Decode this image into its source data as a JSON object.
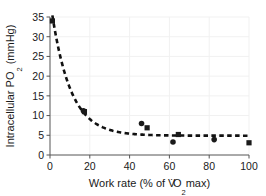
{
  "chart_data": {
    "type": "scatter",
    "title": "",
    "xlabel": "Work rate (% of VO2max)",
    "xlabel_parts": {
      "pre": "Work rate (% of ",
      "v": "V",
      "overdot": "˙",
      "o": "O",
      "sub": "2",
      "post": "max)"
    },
    "ylabel": "Intracellular PO2 (mmHg)",
    "ylabel_parts": {
      "pre": "Intracellular PO",
      "sub": "2",
      "post": " (mmHg)"
    },
    "xlim": [
      0,
      100
    ],
    "ylim": [
      0,
      35
    ],
    "xticks": [
      0,
      20,
      40,
      60,
      80,
      100
    ],
    "yticks": [
      0,
      5,
      10,
      15,
      20,
      25,
      30,
      35
    ],
    "xtick_labels": [
      "0",
      "20",
      "40",
      "60",
      "80",
      "100"
    ],
    "ytick_labels": [
      "0",
      "5",
      "10",
      "15",
      "20",
      "25",
      "30",
      "35"
    ],
    "grid": true,
    "grid_color": "#f1f1f1",
    "legend": "none",
    "marker_color": "#1a1a1a",
    "curve_color": "#111111",
    "curve_style": "dashed",
    "series": [
      {
        "name": "square-markers",
        "marker": "square",
        "points": [
          {
            "x": 1.2,
            "y": 34.0
          },
          {
            "x": 17.3,
            "y": 11.0
          },
          {
            "x": 48.8,
            "y": 6.9
          },
          {
            "x": 64.5,
            "y": 5.2
          },
          {
            "x": 100.0,
            "y": 3.1
          }
        ]
      },
      {
        "name": "circle-markers",
        "marker": "circle",
        "points": [
          {
            "x": 16.8,
            "y": 11.2
          },
          {
            "x": 46.0,
            "y": 8.0
          },
          {
            "x": 61.8,
            "y": 3.3
          },
          {
            "x": 82.5,
            "y": 3.9
          }
        ]
      }
    ],
    "fit_curve": {
      "name": "exponential-decay-fit",
      "description": "y = 4.9 + 30.5 * exp(-x/9.5)",
      "asymptote": 4.9,
      "amplitude": 30.5,
      "rate": 9.5,
      "x_start": 1.2,
      "x_end": 100
    }
  }
}
